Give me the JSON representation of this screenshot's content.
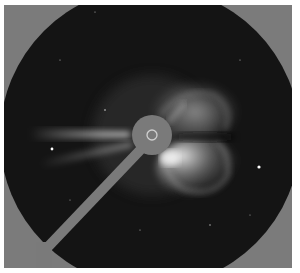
{
  "image": {
    "subject": "coronagraph image of a coronal mass ejection",
    "colors": {
      "background_gray": "#7b7b7b",
      "field_dark": "#141414",
      "occulter_gray": "#7a7a7a",
      "ring": "#cfcfcf",
      "cme_bright": "#e8e8e8"
    },
    "field": {
      "cx": 150,
      "cy": 137,
      "r": 150
    },
    "occulter": {
      "cx": 152,
      "cy": 135,
      "r": 20,
      "sun_ring_r": 5
    },
    "pylon": {
      "x1": 145,
      "y1": 145,
      "x2": 45,
      "y2": 250,
      "width": 10
    },
    "stars": [
      {
        "x": 52,
        "y": 149,
        "r": 1.4
      },
      {
        "x": 259,
        "y": 167,
        "r": 1.6
      },
      {
        "x": 105,
        "y": 110,
        "r": 0.8
      },
      {
        "x": 210,
        "y": 225,
        "r": 0.7
      },
      {
        "x": 60,
        "y": 60,
        "r": 0.6
      },
      {
        "x": 240,
        "y": 60,
        "r": 0.6
      }
    ]
  }
}
